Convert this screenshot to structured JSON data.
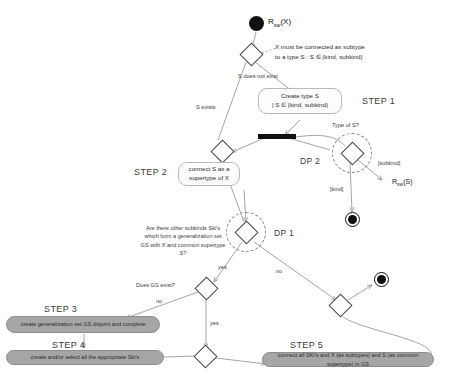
{
  "diagram": {
    "start": {
      "label_main": "R",
      "label_sub": "sw",
      "label_tail": "(X)"
    },
    "notes": [
      {
        "id": "note-subtype",
        "text": "X must be connected as subtype"
      },
      {
        "id": "note-subtype2",
        "text": "to a type S : S ∈ {kind, subkind}"
      }
    ],
    "decisions": [
      {
        "id": "d-s-exists",
        "question": ""
      },
      {
        "id": "dp2",
        "question": "Type of S?",
        "tag": "DP 2"
      },
      {
        "id": "dp1",
        "question": "Are there other subkinds Ski's which form a generalization set GS with X and common supertype S?",
        "tag": "DP 1"
      },
      {
        "id": "d-gs-exist",
        "question": "Does GS exist?"
      }
    ],
    "edge_labels": {
      "s_does_not_exist": "S does not exist",
      "s_exists": "S exists",
      "subkind": "[subkind]",
      "kind": "[kind]",
      "dp1_yes": "yes",
      "dp1_no": "no",
      "gs_yes": "yes",
      "gs_no": "no"
    },
    "actions": [
      {
        "id": "create-type-s",
        "line1": "Create type S",
        "line2": "| S ∈ {kind, subkind}",
        "style": "plain"
      },
      {
        "id": "connect-supertype",
        "line1": "connect S as a",
        "line2": "supertype of X",
        "style": "plain"
      },
      {
        "id": "create-gs",
        "line1": "create generalization set GS disjoint and complete",
        "line2": "",
        "style": "gray"
      },
      {
        "id": "create-select-ski",
        "line1": "create and/or select all the appropriate Ski's",
        "line2": "",
        "style": "gray"
      },
      {
        "id": "connect-all",
        "line1": "connect all SKi's and X (as subtypes) and S (as common supertype) in GS",
        "line2": "",
        "style": "gray"
      }
    ],
    "steps": [
      {
        "id": "step1",
        "label": "STEP 1"
      },
      {
        "id": "step2",
        "label": "STEP 2"
      },
      {
        "id": "step3",
        "label": "STEP 3"
      },
      {
        "id": "step4",
        "label": "STEP 4"
      },
      {
        "id": "step5",
        "label": "STEP 5"
      }
    ],
    "rule_refs": [
      {
        "id": "rsw-s",
        "label_main": "R",
        "label_sub": "sw",
        "label_tail": "(S)"
      }
    ],
    "colors": {
      "ink": "#1a1a1a",
      "edge": "#8d8d8d",
      "gray_box": "#a6a6a6",
      "node_fill": "#111111"
    }
  }
}
